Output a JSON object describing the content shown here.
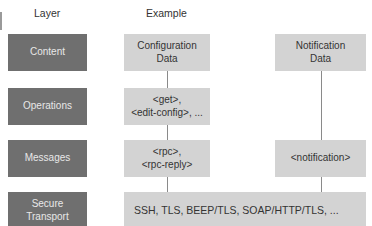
{
  "headers": {
    "layer": "Layer",
    "example": "Example"
  },
  "layers": [
    {
      "label": "Content"
    },
    {
      "label": "Operations"
    },
    {
      "label": "Messages"
    },
    {
      "label": "Secure\nTransport"
    }
  ],
  "examples": {
    "content_config": "Configuration\nData",
    "content_notification": "Notification\nData",
    "operations": "<get>,\n<edit-config>, ...",
    "messages_rpc": "<rpc>,\n<rpc-reply>",
    "messages_notification": "<notification>",
    "transport": "SSH, TLS, BEEP/TLS, SOAP/HTTP/TLS, ..."
  },
  "colors": {
    "layer_box": "#6f6f6f",
    "example_box": "#d3d3d3",
    "connector": "#8a8a8a"
  }
}
